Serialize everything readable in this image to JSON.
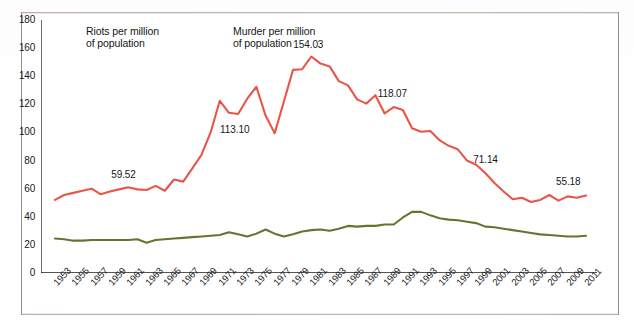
{
  "chart_data": {
    "type": "line",
    "title": "",
    "xlabel": "",
    "ylabel": "",
    "ylim": [
      0,
      180
    ],
    "ytick_step": 20,
    "yticks": [
      0,
      20,
      40,
      60,
      80,
      100,
      120,
      140,
      160,
      180
    ],
    "grid": false,
    "legend_position": "top-left-inside",
    "x_tick_interval_years": 1,
    "x_label_interval_years": 2,
    "x": [
      1953,
      1954,
      1955,
      1956,
      1957,
      1958,
      1959,
      1960,
      1961,
      1962,
      1963,
      1964,
      1965,
      1966,
      1967,
      1968,
      1969,
      1970,
      1971,
      1972,
      1973,
      1974,
      1975,
      1976,
      1977,
      1978,
      1979,
      1980,
      1981,
      1982,
      1983,
      1984,
      1985,
      1986,
      1987,
      1988,
      1989,
      1990,
      1991,
      1992,
      1993,
      1994,
      1995,
      1996,
      1997,
      1998,
      1999,
      2000,
      2001,
      2002,
      2003,
      2004,
      2005,
      2006,
      2007,
      2008,
      2009,
      2010,
      2011
    ],
    "xtick_labels": [
      "1953",
      "1955",
      "1957",
      "1959",
      "1961",
      "1963",
      "1965",
      "1967",
      "1969",
      "1971",
      "1973",
      "1975",
      "1977",
      "1979",
      "1981",
      "1983",
      "1985",
      "1987",
      "1989",
      "1991",
      "1993",
      "1995",
      "1997",
      "1999",
      "2001",
      "2003",
      "2005",
      "2007",
      "2009",
      "2011"
    ],
    "series": [
      {
        "name": "Riots per million of population",
        "color": "#e8564a",
        "values": [
          52.0,
          55.5,
          57.0,
          58.5,
          60.0,
          56.0,
          58.0,
          59.5,
          61.0,
          59.5,
          59.0,
          62.0,
          58.5,
          66.5,
          65.0,
          74.5,
          84.0,
          100.0,
          122.5,
          114.0,
          113.1,
          124.0,
          132.5,
          112.0,
          99.5,
          122.0,
          144.5,
          145.0,
          154.03,
          149.0,
          147.0,
          136.5,
          133.5,
          123.5,
          120.5,
          126.5,
          113.5,
          118.07,
          116.0,
          103.0,
          100.5,
          101.0,
          94.5,
          90.5,
          88.0,
          80.0,
          77.0,
          71.14,
          64.0,
          58.0,
          52.5,
          53.5,
          50.5,
          52.0,
          55.5,
          51.5,
          54.5,
          53.5,
          55.18
        ]
      },
      {
        "name": "Murder per million of population",
        "color": "#6b7230",
        "values": [
          24.5,
          24.0,
          23.0,
          23.0,
          23.5,
          23.5,
          23.5,
          23.5,
          23.5,
          24.0,
          21.5,
          23.5,
          24.0,
          24.5,
          25.0,
          25.5,
          26.0,
          26.5,
          27.0,
          29.0,
          27.5,
          26.0,
          28.0,
          31.0,
          28.0,
          26.0,
          27.5,
          29.5,
          30.5,
          31.0,
          30.0,
          31.5,
          33.5,
          33.0,
          33.5,
          33.5,
          34.5,
          34.5,
          39.5,
          43.5,
          43.5,
          41.0,
          39.0,
          38.0,
          37.5,
          36.5,
          35.5,
          33.0,
          32.5,
          31.5,
          30.5,
          29.5,
          28.5,
          27.5,
          27.0,
          26.5,
          26.0,
          26.0,
          26.5
        ]
      }
    ],
    "annotations": [
      {
        "label": "59.52",
        "x": 1961,
        "value": 59.52
      },
      {
        "label": "113.10",
        "x": 1973,
        "value": 113.1
      },
      {
        "label": "154.03",
        "x": 1981,
        "value": 154.03
      },
      {
        "label": "118.07",
        "x": 1990,
        "value": 118.07
      },
      {
        "label": "71.14",
        "x": 2000,
        "value": 71.14
      },
      {
        "label": "55.18",
        "x": 2011,
        "value": 55.18
      }
    ]
  },
  "legend": {
    "entries": [
      {
        "label": "Riots per million\nof population",
        "color": "#e8564a",
        "swatch_name": "riots-legend-swatch"
      },
      {
        "label": "Murder per million\nof population",
        "color": "#6b7230",
        "swatch_name": "murder-legend-swatch"
      }
    ]
  },
  "colors": {
    "riots": "#e8564a",
    "murder": "#6b7230",
    "axis": "#1b1d1f",
    "frame": "#8b8f93",
    "text": "#15171a"
  }
}
